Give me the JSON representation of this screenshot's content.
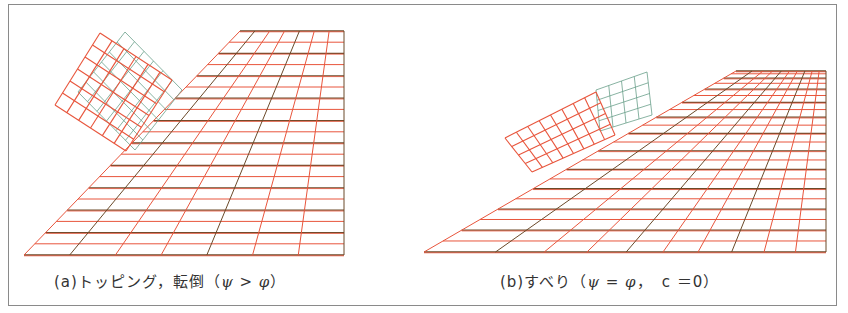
{
  "figure": {
    "panels": [
      {
        "id": "a",
        "label": "(a)",
        "title": "トッピング，転倒",
        "condition_open": "（",
        "psi": "ψ",
        "relation": " > ",
        "phi": "φ",
        "extra": "",
        "condition_close": "）",
        "description": "Toppling block resting on steep slope mesh; original position shown in green/blue, rotated position in red"
      },
      {
        "id": "b",
        "label": "(b)",
        "title": "すべり",
        "condition_open": "（",
        "psi": "ψ",
        "relation": " = ",
        "phi": "φ",
        "extra": "，　c ＝0",
        "condition_close": "）",
        "description": "Sliding block on gentler slope mesh; original position in green, displaced position in red"
      }
    ],
    "colors": {
      "mesh_line": "#e8553c",
      "mesh_dark": "#6b4a2a",
      "original_block": "#6aa08a",
      "frame": "#8a8a8a",
      "text": "#333333"
    }
  }
}
